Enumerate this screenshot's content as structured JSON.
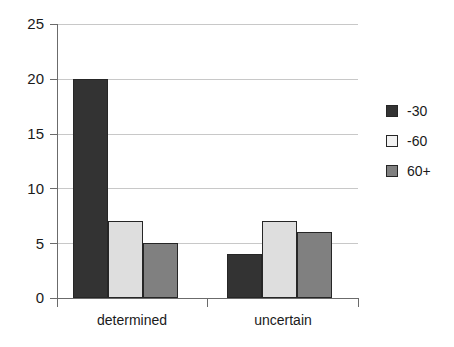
{
  "chart_data": {
    "type": "bar",
    "title": "",
    "subtitle": "",
    "xlabel": "",
    "ylabel": "",
    "categories": [
      "determined",
      "uncertain"
    ],
    "series": [
      {
        "name": "-30",
        "values": [
          20,
          4
        ],
        "color": "#333333"
      },
      {
        "name": "-60",
        "values": [
          7,
          7
        ],
        "color": "#dedede"
      },
      {
        "name": "60+",
        "values": [
          5,
          6
        ],
        "color": "#808080"
      }
    ],
    "ylim": [
      0,
      25
    ],
    "ytick_labels": [
      "0",
      "5",
      "10",
      "15",
      "20",
      "25"
    ],
    "ytick_values": [
      0,
      5,
      10,
      15,
      20,
      25
    ],
    "grid": true,
    "grid_axis": "y",
    "legend_position": "right",
    "bar_border_color": "#262626",
    "gridline_color": "#c8c8c8",
    "axis_color": "#6b6b6b",
    "background": "#ffffff"
  },
  "axis": {
    "y": {
      "tick_25": "25",
      "tick_20": "20",
      "tick_15": "15",
      "tick_10": "10",
      "tick_5": "5",
      "tick_0": "0"
    },
    "x": {
      "cat_0": "determined",
      "cat_1": "uncertain"
    }
  },
  "legend": {
    "items": [
      {
        "label": "-30"
      },
      {
        "label": "-60"
      },
      {
        "label": "60+"
      }
    ]
  }
}
